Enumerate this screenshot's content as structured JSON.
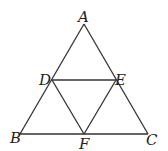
{
  "diagram": {
    "type": "geometry",
    "points": [
      {
        "name": "A",
        "x": 84,
        "y": 24,
        "label_x": 78,
        "label_y": 22
      },
      {
        "name": "B",
        "x": 20,
        "y": 134,
        "label_x": 10,
        "label_y": 143
      },
      {
        "name": "C",
        "x": 148,
        "y": 134,
        "label_x": 146,
        "label_y": 145
      },
      {
        "name": "D",
        "x": 52,
        "y": 80,
        "label_x": 39,
        "label_y": 85
      },
      {
        "name": "E",
        "x": 116,
        "y": 80,
        "label_x": 115,
        "label_y": 85
      },
      {
        "name": "F",
        "x": 84,
        "y": 134,
        "label_x": 79,
        "label_y": 149
      }
    ],
    "segments": [
      [
        "A",
        "B"
      ],
      [
        "A",
        "C"
      ],
      [
        "B",
        "C"
      ],
      [
        "D",
        "E"
      ],
      [
        "D",
        "F"
      ],
      [
        "E",
        "F"
      ]
    ],
    "labels": {
      "A": "A",
      "B": "B",
      "C": "C",
      "D": "D",
      "E": "E",
      "F": "F"
    },
    "stroke_color": "#333333"
  }
}
